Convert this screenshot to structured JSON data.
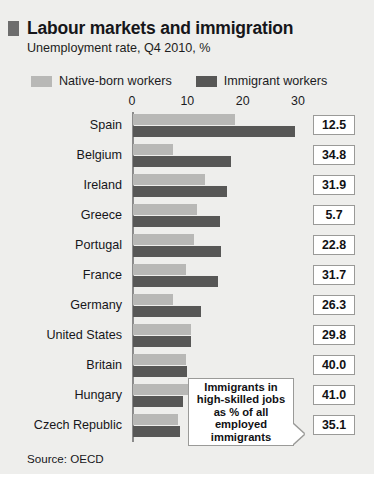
{
  "figure": {
    "title": "Labour markets and immigration",
    "subtitle": "Unemployment rate, Q4 2010, %",
    "source": "Source: OECD",
    "callout": [
      "Immigrants in",
      "high-skilled jobs",
      "as % of all",
      "employed",
      "immigrants"
    ],
    "colors": {
      "native": "#b8b8b6",
      "immigrant": "#575756",
      "background": "#eeeeec",
      "axis": "#8b8b8b",
      "box_border": "#9a9a98"
    }
  },
  "chart_data": {
    "type": "bar",
    "orientation": "horizontal",
    "title": "Labour markets and immigration",
    "subtitle": "Unemployment rate, Q4 2010, %",
    "xlabel": "",
    "ylabel": "",
    "xlim": [
      0,
      33
    ],
    "xticks": [
      0,
      10,
      20,
      30
    ],
    "grid": false,
    "legend_position": "top",
    "categories": [
      "Spain",
      "Belgium",
      "Ireland",
      "Greece",
      "Portugal",
      "France",
      "Germany",
      "United States",
      "Britain",
      "Hungary",
      "Czech Republic"
    ],
    "series": [
      {
        "name": "Native-born workers",
        "color": "#b8b8b6",
        "values": [
          18.5,
          7.2,
          13.0,
          11.6,
          11.0,
          9.5,
          7.2,
          10.4,
          9.5,
          12.3,
          8.2
        ]
      },
      {
        "name": "Immigrant workers",
        "color": "#575756",
        "values": [
          29.3,
          17.8,
          17.0,
          15.8,
          15.9,
          15.3,
          12.2,
          10.4,
          9.7,
          9.0,
          8.5
        ]
      }
    ],
    "annotation_column": {
      "label": "Immigrants in high-skilled jobs as % of all employed immigrants",
      "values": [
        12.5,
        34.8,
        31.9,
        5.7,
        22.8,
        31.7,
        26.3,
        29.8,
        40.0,
        41.0,
        35.1
      ]
    },
    "source": "Source: OECD"
  }
}
